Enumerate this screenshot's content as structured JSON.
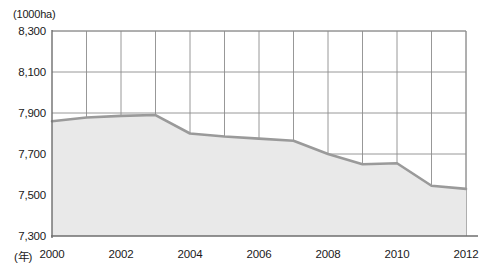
{
  "chart_data": {
    "type": "area",
    "title": "",
    "subtitle": "",
    "unit_label": "(1000ha)",
    "xlabel": "(年)",
    "ylabel": "",
    "x": [
      2000,
      2001,
      2002,
      2003,
      2004,
      2005,
      2006,
      2007,
      2008,
      2009,
      2010,
      2011,
      2012
    ],
    "values": [
      7860,
      7878,
      7886,
      7890,
      7800,
      7785,
      7775,
      7765,
      7700,
      7650,
      7655,
      7545,
      7530
    ],
    "series": [
      {
        "name": "耕地面積",
        "values": [
          7860,
          7878,
          7886,
          7890,
          7800,
          7785,
          7775,
          7765,
          7700,
          7650,
          7655,
          7545,
          7530
        ]
      }
    ],
    "xlim": [
      2000,
      2012
    ],
    "ylim": [
      7300,
      8300
    ],
    "y_ticks": [
      7300,
      7500,
      7700,
      7900,
      8100,
      8300
    ],
    "y_tick_labels": [
      "7,300",
      "7,500",
      "7,700",
      "7,900",
      "8,100",
      "8,300"
    ],
    "x_ticks": [
      2000,
      2001,
      2002,
      2003,
      2004,
      2005,
      2006,
      2007,
      2008,
      2009,
      2010,
      2011,
      2012
    ],
    "x_tick_labels_shown": [
      {
        "value": 2000,
        "label": "2000"
      },
      {
        "value": 2002,
        "label": "2002"
      },
      {
        "value": 2004,
        "label": "2004"
      },
      {
        "value": 2006,
        "label": "2006"
      },
      {
        "value": 2008,
        "label": "2008"
      },
      {
        "value": 2010,
        "label": "2010"
      },
      {
        "value": 2012,
        "label": "2012"
      }
    ],
    "grid": true,
    "grid_x": true,
    "grid_y": true,
    "legend": false,
    "legend_position": "none",
    "colors": {
      "line": "#9a9a9a",
      "fill": "#e9e9e9",
      "grid": "#8c8c8c",
      "axis": "#6e6e6e",
      "text": "#1a1a1a",
      "background": "#ffffff"
    }
  }
}
